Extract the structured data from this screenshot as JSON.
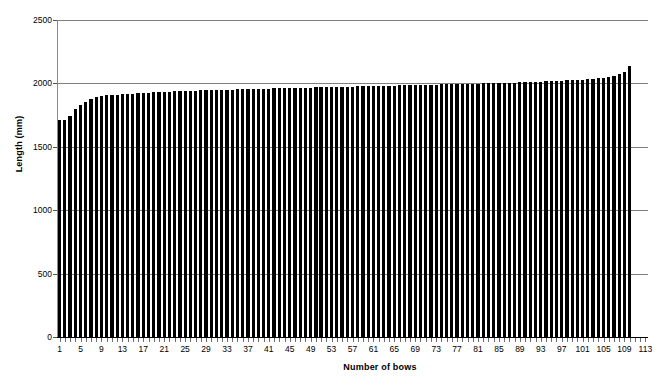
{
  "chart_data": {
    "type": "bar",
    "title": "",
    "xlabel": "Number of bows",
    "ylabel": "Length (mm)",
    "xlim": [
      0,
      113
    ],
    "ylim": [
      0,
      2500
    ],
    "y_ticks": [
      0,
      500,
      1000,
      1500,
      2000,
      2500
    ],
    "y_tick_labels": [
      "0",
      "500",
      "1000",
      "1500",
      "2000",
      "2500"
    ],
    "x_tick_labels": [
      "1",
      "5",
      "9",
      "13",
      "17",
      "21",
      "25",
      "29",
      "33",
      "37",
      "41",
      "45",
      "49",
      "53",
      "57",
      "61",
      "65",
      "69",
      "73",
      "77",
      "81",
      "85",
      "89",
      "93",
      "97",
      "101",
      "105",
      "109",
      "113"
    ],
    "x_tick_positions": [
      1,
      5,
      9,
      13,
      17,
      21,
      25,
      29,
      33,
      37,
      41,
      45,
      49,
      53,
      57,
      61,
      65,
      69,
      73,
      77,
      81,
      85,
      89,
      93,
      97,
      101,
      105,
      109,
      113
    ],
    "grid": "horizontal",
    "legend": "none",
    "bar_color": "#000000",
    "gridline_color": "#808080",
    "categories": [
      1,
      2,
      3,
      4,
      5,
      6,
      7,
      8,
      9,
      10,
      11,
      12,
      13,
      14,
      15,
      16,
      17,
      18,
      19,
      20,
      21,
      22,
      23,
      24,
      25,
      26,
      27,
      28,
      29,
      30,
      31,
      32,
      33,
      34,
      35,
      36,
      37,
      38,
      39,
      40,
      41,
      42,
      43,
      44,
      45,
      46,
      47,
      48,
      49,
      50,
      51,
      52,
      53,
      54,
      55,
      56,
      57,
      58,
      59,
      60,
      61,
      62,
      63,
      64,
      65,
      66,
      67,
      68,
      69,
      70,
      71,
      72,
      73,
      74,
      75,
      76,
      77,
      78,
      79,
      80,
      81,
      82,
      83,
      84,
      85,
      86,
      87,
      88,
      89,
      90,
      91,
      92,
      93,
      94,
      95,
      96,
      97,
      98,
      99,
      100,
      101,
      102,
      103,
      104,
      105,
      106,
      107,
      108,
      109,
      110
    ],
    "values": [
      1710,
      1715,
      1745,
      1800,
      1830,
      1855,
      1878,
      1892,
      1900,
      1905,
      1908,
      1912,
      1915,
      1918,
      1920,
      1922,
      1925,
      1928,
      1930,
      1932,
      1934,
      1936,
      1938,
      1940,
      1941,
      1942,
      1944,
      1945,
      1946,
      1947,
      1948,
      1950,
      1951,
      1952,
      1953,
      1954,
      1955,
      1956,
      1957,
      1958,
      1959,
      1960,
      1961,
      1962,
      1963,
      1964,
      1965,
      1966,
      1967,
      1968,
      1969,
      1970,
      1971,
      1972,
      1973,
      1974,
      1975,
      1976,
      1977,
      1978,
      1979,
      1980,
      1981,
      1982,
      1983,
      1984,
      1985,
      1986,
      1987,
      1988,
      1989,
      1990,
      1991,
      1992,
      1993,
      1994,
      1995,
      1996,
      1997,
      1998,
      1999,
      2000,
      2001,
      2002,
      2003,
      2004,
      2005,
      2007,
      2008,
      2010,
      2011,
      2013,
      2014,
      2016,
      2018,
      2020,
      2022,
      2024,
      2026,
      2028,
      2030,
      2033,
      2036,
      2040,
      2045,
      2052,
      2060,
      2072,
      2090,
      2135
    ]
  }
}
